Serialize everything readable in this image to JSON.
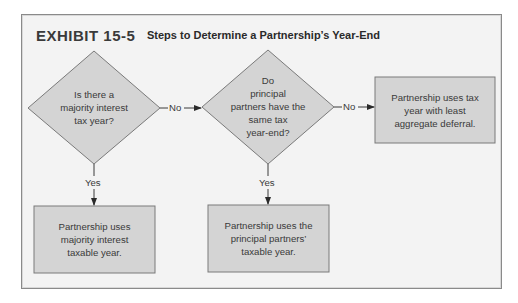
{
  "exhibit": {
    "number": "EXHIBIT 15-5",
    "title": "Steps to Determine a Partnership’s Year-End"
  },
  "nodes": {
    "decision1": {
      "type": "diamond",
      "lines": [
        "Is there a",
        "majority interest",
        "tax year?"
      ]
    },
    "decision2": {
      "type": "diamond",
      "lines": [
        "Do",
        "principal",
        "partners have the",
        "same tax",
        "year-end?"
      ]
    },
    "outcome_no_no": {
      "type": "box",
      "lines": [
        "Partnership uses tax",
        "year with least",
        "aggregate deferral."
      ]
    },
    "outcome_yes1": {
      "type": "box",
      "lines": [
        "Partnership uses",
        "majority interest",
        "taxable year."
      ]
    },
    "outcome_yes2": {
      "type": "box",
      "lines": [
        "Partnership uses the",
        "principal partners’",
        "taxable year."
      ]
    }
  },
  "edges": {
    "d1_no": {
      "from": "decision1",
      "to": "decision2",
      "label": "No"
    },
    "d2_no": {
      "from": "decision2",
      "to": "outcome_no_no",
      "label": "No"
    },
    "d1_yes": {
      "from": "decision1",
      "to": "outcome_yes1",
      "label": "Yes"
    },
    "d2_yes": {
      "from": "decision2",
      "to": "outcome_yes2",
      "label": "Yes"
    }
  },
  "colors": {
    "shape_fill": "#d4d4d4",
    "shape_stroke": "#7a7a7a",
    "background": "#f3f3f3",
    "text": "#3a3a3a"
  }
}
